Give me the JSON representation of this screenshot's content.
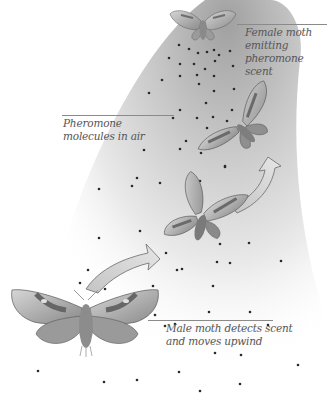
{
  "diagram": {
    "labels": {
      "female": {
        "line1": "Female moth",
        "line2": "emitting",
        "line3": "pheromone scent"
      },
      "molecules": {
        "line1": "Pheromone",
        "line2": "molecules in air"
      },
      "male": {
        "line1": "Male moth detects scent",
        "line2": "and moves upwind"
      }
    },
    "colors": {
      "background": "#ffffff",
      "plume": "#9a9a9a",
      "dot": "#2a2a2a",
      "wing_light": "#c9c9c9",
      "wing_dark": "#6e6e6e",
      "arrow_fill": "#d4d4d4",
      "arrow_stroke": "#6a6a6a",
      "text": "#555555"
    },
    "elements": [
      {
        "type": "moth",
        "role": "female",
        "position": "top-center"
      },
      {
        "type": "moth",
        "role": "male",
        "stage": 3,
        "position": "upper-right"
      },
      {
        "type": "moth",
        "role": "male",
        "stage": 2,
        "position": "middle"
      },
      {
        "type": "moth",
        "role": "male",
        "stage": 1,
        "position": "bottom-left"
      },
      {
        "type": "arrow",
        "from": "stage1",
        "to": "stage2"
      },
      {
        "type": "arrow",
        "from": "stage2",
        "to": "stage3"
      }
    ]
  }
}
